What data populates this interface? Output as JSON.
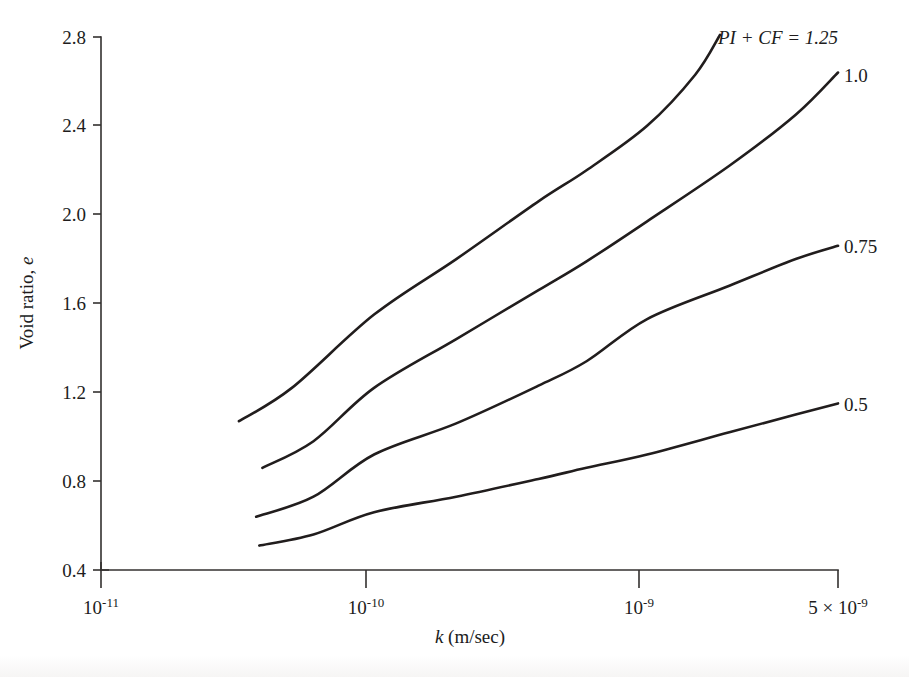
{
  "chart_data": {
    "type": "line",
    "title": "",
    "subtitle": "",
    "xlabel": "k (m/sec)",
    "xlabel_parts": {
      "italic": "k",
      "rest": " (m/sec)"
    },
    "ylabel": "Void ratio, e",
    "ylabel_parts": {
      "rest": "Void ratio, ",
      "italic": "e"
    },
    "xscale": "log",
    "yscale": "linear",
    "xlim": [
      1e-11,
      5e-09
    ],
    "ylim": [
      0.4,
      2.8
    ],
    "grid": false,
    "legend_position": "inline-right-of-curve-ends",
    "xticks": [
      {
        "value": 1e-11,
        "label": "10⁻¹¹",
        "mantissa": "10",
        "exponent": "-11"
      },
      {
        "value": 1e-10,
        "label": "10⁻¹⁰",
        "mantissa": "10",
        "exponent": "-10"
      },
      {
        "value": 1e-09,
        "label": "10⁻⁹",
        "mantissa": "10",
        "exponent": "-9"
      },
      {
        "value": 5e-09,
        "label": "5 × 10⁻⁹",
        "prefix": "5 × ",
        "mantissa": "10",
        "exponent": "-9"
      }
    ],
    "yticks": [
      {
        "value": 0.4,
        "label": "0.4"
      },
      {
        "value": 0.8,
        "label": "0.8"
      },
      {
        "value": 1.2,
        "label": "1.2"
      },
      {
        "value": 1.6,
        "label": "1.6"
      },
      {
        "value": 2.0,
        "label": "2.0"
      },
      {
        "value": 2.4,
        "label": "2.4"
      },
      {
        "value": 2.8,
        "label": "2.8"
      }
    ],
    "series_label_prefix": "PI + CF = ",
    "series": [
      {
        "name": "PI + CF = 1.25",
        "label": "1.25",
        "label_with_prefix": "PI + CF = 1.25",
        "color": "#211d1d",
        "x": [
          3.2e-11,
          5e-11,
          1e-10,
          2e-10,
          4e-10,
          6e-10,
          1e-09,
          1.5e-09,
          1.85e-09
        ],
        "y": [
          1.07,
          1.22,
          1.55,
          1.8,
          2.06,
          2.2,
          2.4,
          2.63,
          2.81
        ]
      },
      {
        "name": "PI + CF = 1.0",
        "label": "1.0",
        "label_with_prefix": "1.0",
        "color": "#211d1d",
        "x": [
          3.9e-11,
          6e-11,
          1e-10,
          2e-10,
          4e-10,
          6e-10,
          1e-09,
          2e-09,
          3.5e-09,
          5e-09
        ],
        "y": [
          0.86,
          0.98,
          1.22,
          1.44,
          1.66,
          1.79,
          1.97,
          2.22,
          2.45,
          2.64
        ]
      },
      {
        "name": "PI + CF = 0.75",
        "label": "0.75",
        "label_with_prefix": "0.75",
        "color": "#211d1d",
        "x": [
          3.7e-11,
          6e-11,
          1e-10,
          2e-10,
          4e-10,
          6e-10,
          1e-09,
          2e-09,
          3.5e-09,
          5e-09
        ],
        "y": [
          0.64,
          0.73,
          0.92,
          1.06,
          1.23,
          1.34,
          1.53,
          1.68,
          1.8,
          1.86
        ]
      },
      {
        "name": "PI + CF = 0.5",
        "label": "0.5",
        "label_with_prefix": "0.5",
        "color": "#211d1d",
        "x": [
          3.8e-11,
          6e-11,
          1e-10,
          2e-10,
          4e-10,
          6e-10,
          1e-09,
          2e-09,
          3.5e-09,
          5e-09
        ],
        "y": [
          0.51,
          0.56,
          0.66,
          0.73,
          0.81,
          0.86,
          0.92,
          1.02,
          1.1,
          1.15
        ]
      }
    ]
  },
  "axes_geometry": {
    "x_left_px": 101,
    "x_right_px": 838,
    "y_bottom_px": 570,
    "y_top_px": 37
  }
}
